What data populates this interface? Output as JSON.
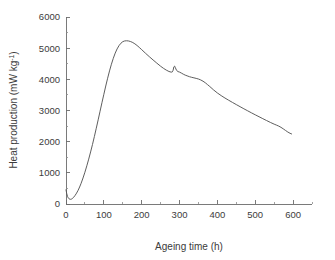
{
  "chart_data": {
    "type": "line",
    "title": "",
    "subtitle": "",
    "xlabel": "Ageing time (h)",
    "ylabel": "Heat production (mW kg",
    "ylabel_exponent": "-1",
    "ylabel_suffix": ")",
    "xlim": [
      0,
      650
    ],
    "ylim": [
      0,
      6000
    ],
    "x_major_ticks": [
      0,
      100,
      200,
      300,
      400,
      500,
      600
    ],
    "x_major_tick_labels": [
      "0",
      "100",
      "200",
      "300",
      "400",
      "500",
      "600"
    ],
    "x_minor_ticks": [
      50,
      150,
      250,
      350,
      450,
      550,
      650
    ],
    "y_major_ticks": [
      0,
      1000,
      2000,
      3000,
      4000,
      5000,
      6000
    ],
    "y_major_tick_labels": [
      "0",
      "1000",
      "2000",
      "3000",
      "4000",
      "5000",
      "6000"
    ],
    "y_minor_ticks": [
      500,
      1500,
      2500,
      3500,
      4500,
      5500
    ],
    "grid": false,
    "legend": false,
    "legend_position": "none",
    "line_color": "#555555",
    "axis_color": "#6b6b6b",
    "background_color": "#ffffff",
    "series": [
      {
        "name": "Heat production",
        "x": [
          0,
          2,
          4,
          6,
          8,
          10,
          12,
          14,
          16,
          18,
          20,
          24,
          28,
          32,
          36,
          40,
          45,
          50,
          55,
          60,
          65,
          70,
          75,
          80,
          85,
          90,
          95,
          100,
          105,
          110,
          115,
          120,
          125,
          130,
          135,
          140,
          145,
          150,
          155,
          160,
          165,
          170,
          175,
          180,
          185,
          190,
          195,
          200,
          210,
          220,
          230,
          240,
          250,
          258,
          265,
          272,
          278,
          281,
          283,
          285,
          287,
          289,
          292,
          296,
          300,
          305,
          310,
          315,
          320,
          326,
          332,
          338,
          344,
          350,
          356,
          362,
          368,
          374,
          380,
          390,
          400,
          410,
          420,
          430,
          440,
          450,
          460,
          470,
          480,
          490,
          500,
          510,
          520,
          530,
          540,
          550,
          556,
          562,
          568,
          574,
          580,
          586,
          592,
          596
        ],
        "y": [
          455,
          330,
          245,
          195,
          168,
          155,
          150,
          155,
          168,
          188,
          213,
          275,
          350,
          440,
          545,
          665,
          835,
          1020,
          1225,
          1440,
          1670,
          1910,
          2165,
          2430,
          2700,
          2975,
          3250,
          3520,
          3785,
          4035,
          4270,
          4485,
          4675,
          4840,
          4975,
          5080,
          5158,
          5208,
          5232,
          5238,
          5232,
          5215,
          5190,
          5155,
          5112,
          5062,
          5008,
          4952,
          4838,
          4728,
          4622,
          4520,
          4420,
          4350,
          4296,
          4252,
          4230,
          4240,
          4290,
          4402,
          4425,
          4372,
          4290,
          4248,
          4232,
          4200,
          4165,
          4135,
          4112,
          4085,
          4065,
          4048,
          4030,
          4010,
          3980,
          3940,
          3890,
          3830,
          3768,
          3660,
          3562,
          3478,
          3400,
          3328,
          3258,
          3190,
          3122,
          3055,
          2990,
          2925,
          2862,
          2800,
          2738,
          2678,
          2618,
          2562,
          2532,
          2500,
          2460,
          2412,
          2360,
          2310,
          2268,
          2248
        ]
      }
    ]
  }
}
